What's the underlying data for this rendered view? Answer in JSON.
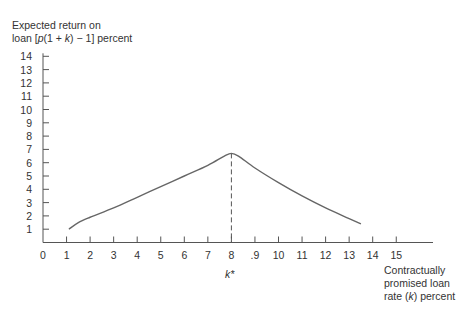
{
  "chart_data": {
    "type": "line",
    "title": "",
    "ylabel_line1": "Expected return on",
    "ylabel_line2_pre": "loan [",
    "ylabel_line2_p": "p",
    "ylabel_line2_mid": "(1 + ",
    "ylabel_line2_k": "k",
    "ylabel_line2_post": ") − 1] percent",
    "xlabel_line1": "Contractually",
    "xlabel_line2": "promised loan",
    "xlabel_line3_pre": "rate (",
    "xlabel_line3_k": "k",
    "xlabel_line3_post": ") percent",
    "xticks": [
      "0",
      "1",
      "2",
      "3",
      "4",
      "5",
      "6",
      "7",
      "8",
      ".9",
      "10",
      "11",
      "12",
      "13",
      "14",
      "15"
    ],
    "yticks": [
      "1",
      "2",
      "3",
      "4",
      "5",
      "6",
      "7",
      "8",
      "9",
      "10",
      "11",
      "12",
      "13",
      "14"
    ],
    "xlim": [
      0,
      16.5
    ],
    "ylim": [
      0,
      14
    ],
    "grid": false,
    "annotation": {
      "label": "k*",
      "x": 8,
      "style": "dashed vertical line from axis to peak"
    },
    "series": [
      {
        "name": "Expected return",
        "x": [
          1.1,
          1.5,
          2,
          3,
          4,
          5,
          6,
          7,
          7.7,
          8,
          8.3,
          9,
          10,
          11,
          12,
          13,
          13.5
        ],
        "y": [
          1.0,
          1.5,
          1.9,
          2.6,
          3.4,
          4.2,
          5.0,
          5.8,
          6.5,
          6.7,
          6.5,
          5.6,
          4.5,
          3.5,
          2.6,
          1.8,
          1.4
        ]
      }
    ],
    "peak": {
      "x": 8,
      "y": 6.7
    }
  }
}
